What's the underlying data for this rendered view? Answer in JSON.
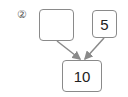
{
  "problem": {
    "number_label": "②",
    "left_box_value": "",
    "right_box_value": "5",
    "total_value": "10"
  },
  "colors": {
    "border": "#8a8a8a",
    "arrow": "#8a8a8a",
    "text": "#222222"
  }
}
